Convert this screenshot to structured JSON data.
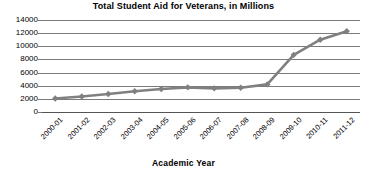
{
  "chart_data": {
    "type": "line",
    "title": "Total Student Aid for Veterans, in Millions",
    "xlabel": "Academic Year",
    "ylabel": "",
    "categories": [
      "2000-01",
      "2001-02",
      "2002-03",
      "2003-04",
      "2004-05",
      "2005-06",
      "2006-07",
      "2007-08",
      "2008-09",
      "2009-10",
      "2010-11",
      "2011-12"
    ],
    "values": [
      2050,
      2350,
      2750,
      3150,
      3500,
      3750,
      3600,
      3700,
      4200,
      8700,
      11000,
      12300
    ],
    "series": [
      {
        "name": "Total Student Aid for Veterans",
        "values": [
          2050,
          2350,
          2750,
          3150,
          3500,
          3750,
          3600,
          3700,
          4200,
          8700,
          11000,
          12300
        ]
      }
    ],
    "ylim": [
      0,
      14000
    ],
    "yticks": [
      0,
      2000,
      4000,
      6000,
      8000,
      10000,
      12000,
      14000
    ],
    "ytick_labels": [
      "0",
      "2000",
      "4000",
      "6000",
      "8000",
      "10000",
      "12000",
      "14000"
    ],
    "grid": true,
    "legend": false,
    "marker": "diamond",
    "series_color": "#808080",
    "grid_color": "#7b7b7b",
    "axis_color": "#555555",
    "background": "#ffffff",
    "xtick_rotation": -45
  }
}
